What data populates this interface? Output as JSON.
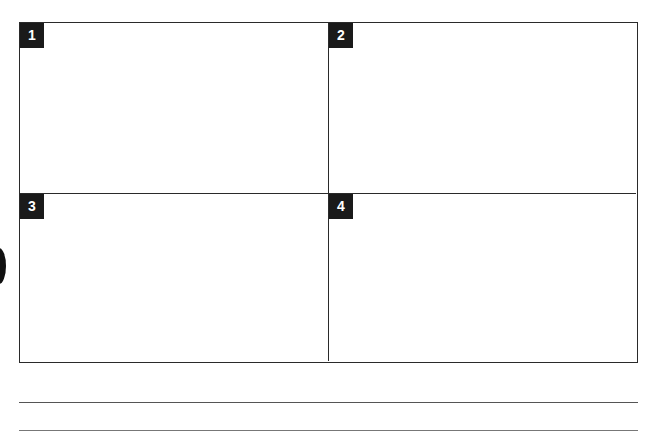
{
  "panels": [
    {
      "label": "1"
    },
    {
      "label": "2"
    },
    {
      "label": "3"
    },
    {
      "label": "4"
    }
  ],
  "answer_lines": 2,
  "colors": {
    "border": "#2a2a2a",
    "badge_bg": "#1a1a1a",
    "badge_text": "#ffffff"
  }
}
